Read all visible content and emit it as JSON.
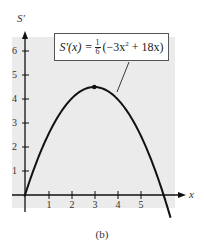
{
  "chart_data": {
    "type": "line",
    "title": "",
    "caption": "(b)",
    "xlabel": "x",
    "ylabel": "S′",
    "xlim": [
      0,
      6.4
    ],
    "ylim": [
      0,
      6.4
    ],
    "x_ticks": [
      1,
      2,
      3,
      4,
      5
    ],
    "y_ticks": [
      1,
      2,
      3,
      4,
      5,
      6
    ],
    "grid": false,
    "background_color": "#ebebeb",
    "series": [
      {
        "name": "S′(x) = 1/6 (−3x² + 18x)",
        "function": "(1/6)*(-3*x^2 + 18*x)",
        "x": [
          0,
          0.5,
          1,
          1.5,
          2,
          2.5,
          3,
          3.5,
          4,
          4.5,
          5,
          5.5,
          6
        ],
        "values": [
          0,
          1.375,
          2.5,
          3.375,
          4.0,
          4.375,
          4.5,
          4.375,
          4.0,
          3.375,
          2.5,
          1.375,
          0
        ],
        "color": "#111111"
      }
    ],
    "annotations": [
      {
        "type": "point",
        "x": 3,
        "y": 4.5,
        "label": "maximum"
      },
      {
        "type": "label_box",
        "text": "S′(x) = 1/6 (−3x² + 18x)",
        "points_to": [
          4.2,
          4.0
        ]
      }
    ]
  },
  "labels": {
    "y_axis": "S′",
    "x_axis": "x",
    "caption": "(b)",
    "y_ticks": [
      "1",
      "2",
      "3",
      "4",
      "5",
      "6"
    ],
    "x_ticks": [
      "1",
      "2",
      "3",
      "4",
      "5"
    ],
    "formula": {
      "lhs": "S′(x) = ",
      "frac_num": "1",
      "frac_den": "6",
      "rhs_pre": "(−3x",
      "rhs_exp": "2",
      "rhs_post": " + 18x)"
    }
  }
}
